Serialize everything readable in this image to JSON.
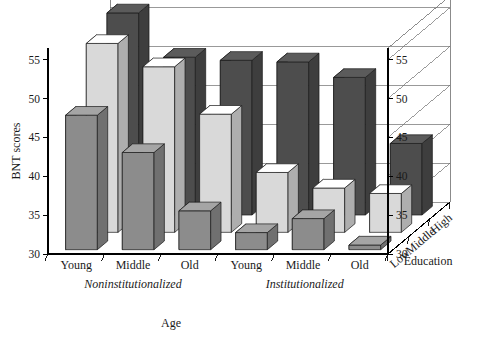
{
  "chart_data": {
    "type": "bar",
    "title": "",
    "xlabel": "Age",
    "ylabel": "BNT scores",
    "zlabel": "Education",
    "ylim": [
      30,
      56.5
    ],
    "yticks": [
      30,
      35,
      40,
      45,
      50,
      55
    ],
    "grid": true,
    "legend": "none",
    "projection": "3d",
    "x_groups": [
      {
        "name": "Noninstitutionalized",
        "categories": [
          "Young",
          "Middle",
          "Old"
        ]
      },
      {
        "name": "Institutionalized",
        "categories": [
          "Young",
          "Middle",
          "Old"
        ]
      }
    ],
    "x_categories": [
      "Young",
      "Middle",
      "Old",
      "Young",
      "Middle",
      "Old"
    ],
    "z_categories": [
      "Low",
      "Middle",
      "High"
    ],
    "series": [
      {
        "name": "Low",
        "color": "#8c8c8c",
        "values": [
          47.3,
          42.5,
          35.0,
          32.2,
          34.0,
          30.6
        ]
      },
      {
        "name": "Middle",
        "color": "#d9d9d9",
        "values": [
          54.3,
          51.3,
          45.2,
          37.7,
          35.7,
          35.0
        ]
      },
      {
        "name": "High",
        "color": "#4d4d4d",
        "values": [
          56.0,
          50.3,
          49.9,
          49.7,
          47.7,
          39.2
        ]
      }
    ],
    "colors": {
      "series_low": "#8c8c8c",
      "series_middle": "#d9d9d9",
      "series_high": "#4d4d4d",
      "axis": "#000000",
      "grid": "#6e6e6e",
      "background": "#ffffff"
    }
  },
  "axes": {
    "y_title": "BNT scores",
    "x_title": "Age",
    "z_title": "Education",
    "y_ticks_left": [
      "55",
      "50",
      "45",
      "40",
      "35",
      "30"
    ],
    "y_ticks_right": [
      "55",
      "50",
      "45",
      "40",
      "35",
      "30"
    ],
    "x_labels": [
      "Young",
      "Middle",
      "Old",
      "Young",
      "Middle",
      "Old"
    ],
    "x_group_labels": [
      "Noninstitutionalized",
      "Institutionalized"
    ],
    "z_labels": [
      "Low",
      "Middle",
      "High"
    ]
  }
}
